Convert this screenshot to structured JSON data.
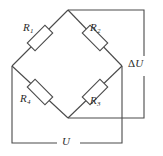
{
  "figure": {
    "kind": "wheatstone-bridge-circuit-diagram",
    "background_color": "#ffffff",
    "line_color": "#4a4a4a",
    "text_color": "#2b2b2b"
  },
  "labels": {
    "r1": "R",
    "r1_sub": "1",
    "r2": "R",
    "r2_sub": "2",
    "r3": "R",
    "r3_sub": "3",
    "r4": "R",
    "r4_sub": "4",
    "delta_symbol": "Δ",
    "delta_u": "U",
    "u": "U"
  },
  "components": {
    "resistors": [
      {
        "name": "R1",
        "position": "upper-left-branch",
        "label_position": "above-left"
      },
      {
        "name": "R2",
        "position": "upper-right-branch",
        "label_position": "above-right"
      },
      {
        "name": "R3",
        "position": "lower-right-branch",
        "label_position": "below-right"
      },
      {
        "name": "R4",
        "position": "lower-left-branch",
        "label_position": "below-left"
      }
    ],
    "terminals": [
      {
        "name": "delta-U",
        "label": "ΔU",
        "position": "right",
        "description": "bridge output voltage"
      },
      {
        "name": "U",
        "label": "U",
        "position": "bottom",
        "description": "supply voltage"
      }
    ],
    "nodes": [
      {
        "name": "top-node",
        "x": 68,
        "y": 10
      },
      {
        "name": "left-node",
        "x": 12,
        "y": 66
      },
      {
        "name": "right-node",
        "x": 122,
        "y": 66
      },
      {
        "name": "bottom-node",
        "x": 68,
        "y": 118
      }
    ]
  }
}
